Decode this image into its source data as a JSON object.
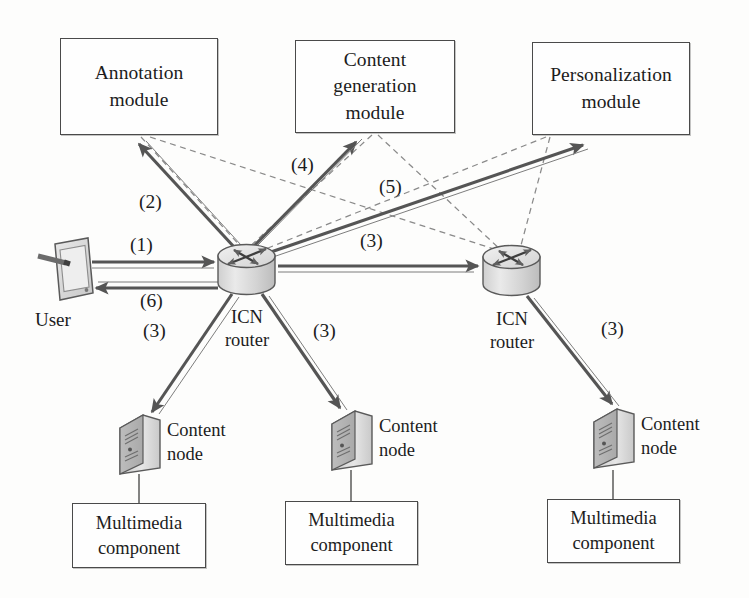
{
  "figure": {
    "palette": {
      "background": "#fdfdfc",
      "stroke": "#4a4a4a",
      "solid_arrow": "#555555",
      "dashed_line": "#8a8a8a",
      "device_fill": "#d9d9d9",
      "text": "#1c1c1c"
    }
  },
  "modules": [
    {
      "id": "annotation",
      "line1": "Annotation",
      "line2": "module"
    },
    {
      "id": "content-generation",
      "line1": "Content",
      "line2": "generation",
      "line3": "module"
    },
    {
      "id": "personalization",
      "line1": "Personalization",
      "line2": "module"
    }
  ],
  "routers": [
    {
      "id": "icn-router-left",
      "line1": "ICN",
      "line2": "router"
    },
    {
      "id": "icn-router-right",
      "line1": "ICN",
      "line2": "router"
    }
  ],
  "user": {
    "label": "User"
  },
  "content_nodes": [
    {
      "id": "content-node-1",
      "line1": "Content",
      "line2": "node"
    },
    {
      "id": "content-node-2",
      "line1": "Content",
      "line2": "node"
    },
    {
      "id": "content-node-3",
      "line1": "Content",
      "line2": "node"
    }
  ],
  "multimedia_components": [
    {
      "id": "multimedia-component-1",
      "line1": "Multimedia",
      "line2": "component"
    },
    {
      "id": "multimedia-component-2",
      "line1": "Multimedia",
      "line2": "component"
    },
    {
      "id": "multimedia-component-3",
      "line1": "Multimedia",
      "line2": "component"
    }
  ],
  "flow_labels": [
    {
      "id": "flow-1",
      "text": "(1)",
      "描述": "user to left ICN router request"
    },
    {
      "id": "flow-2",
      "text": "(2)",
      "描述": "left router to annotation module"
    },
    {
      "id": "flow-3-to-node1",
      "text": "(3)",
      "描述": "left router to content node 1"
    },
    {
      "id": "flow-3-to-node2",
      "text": "(3)",
      "描述": "left router to content node 2"
    },
    {
      "id": "flow-3-router",
      "text": "(3)",
      "描述": "left router to right router"
    },
    {
      "id": "flow-3-to-node3",
      "text": "(3)",
      "描述": "right router to content node 3"
    },
    {
      "id": "flow-4",
      "text": "(4)",
      "描述": "left router to content generation module"
    },
    {
      "id": "flow-5",
      "text": "(5)",
      "描述": "left router to personalization module"
    },
    {
      "id": "flow-6",
      "text": "(6)",
      "描述": "left router back to user"
    }
  ]
}
